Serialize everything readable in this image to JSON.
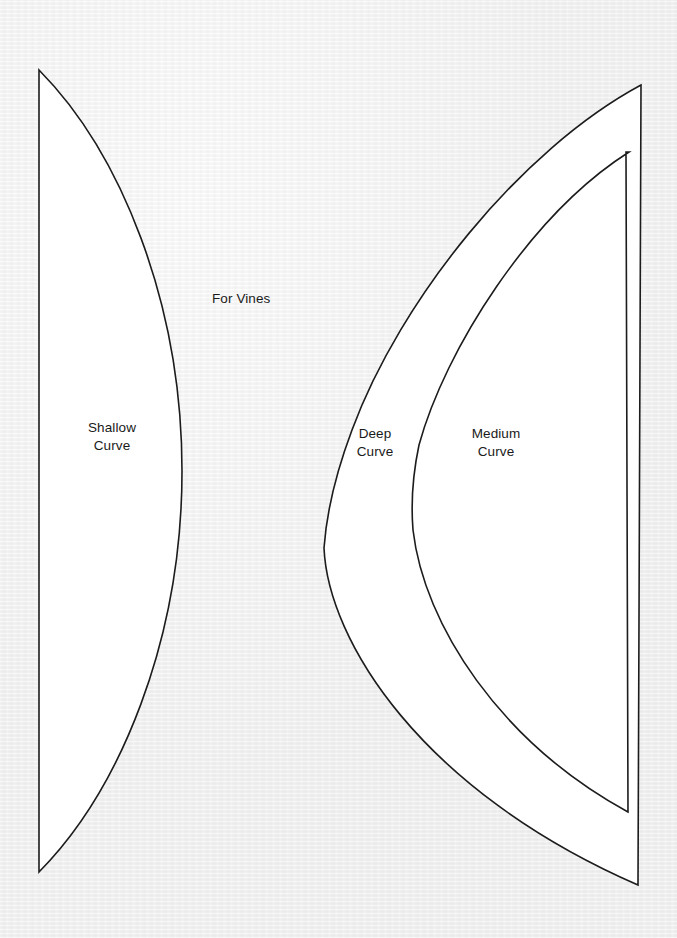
{
  "document": {
    "title": "For Vines",
    "background_color": "#ebebeb",
    "paper_color": "#ffffff",
    "ink_color": "#1c1c1c"
  },
  "labels": {
    "title": "For Vines",
    "shallow_curve": "Shallow\nCurve",
    "deep_curve": "Deep\nCurve",
    "medium_curve": "Medium\nCurve"
  },
  "pieces": [
    {
      "name": "shallow-curve",
      "label": "Shallow\nCurve",
      "description": "Tall white template piece with a straight vertical left edge and a shallow convex curve on the right.",
      "path": "M 39 70 L 39 872 C 120 790 182 640 182 471 C 182 302 120 152 39 70 Z"
    },
    {
      "name": "deep-curve",
      "label": "Deep\nCurve",
      "description": "Tall white template piece with a straight right edge and a deep concave curve on the left.",
      "path": "M 641 85 C 520 150 400 300 352 430 C 334 478 326 520 324 548 C 328 640 420 790 638 885 L 641 85 Z"
    },
    {
      "name": "medium-curve",
      "label": "Medium\nCurve",
      "description": "Inner white template piece nested inside the deep curve piece, with a medium concave curve on the left and a straight right edge.",
      "path": "M 629 152 C 530 215 445 350 419 445 C 412 478 411 505 413 530 C 424 625 500 742 628 812 L 626 152 Z"
    }
  ]
}
